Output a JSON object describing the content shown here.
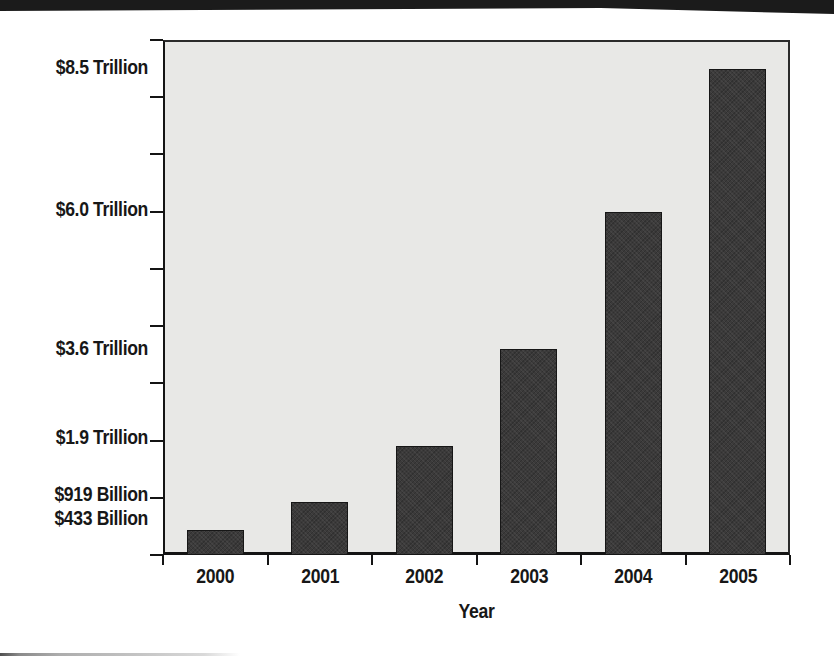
{
  "page": {
    "top_band_color": "#1b1b1b",
    "background_color": "#ffffff"
  },
  "chart_data": {
    "type": "bar",
    "title": "",
    "xlabel": "Year",
    "ylabel": "",
    "categories": [
      "2000",
      "2001",
      "2002",
      "2003",
      "2004",
      "2005"
    ],
    "values": [
      0.433,
      0.919,
      1.9,
      3.6,
      6.0,
      8.5
    ],
    "value_unit": "trillion USD",
    "value_labels": [
      "$433 Billion",
      "$919 Billion",
      "$1.9 Trillion",
      "$3.6 Trillion",
      "$6.0 Trillion",
      "$8.5 Trillion"
    ],
    "ylim": [
      0,
      9
    ],
    "gridline_step": 1.0,
    "grid": true,
    "legend": false,
    "bar_color": "#3b3a3a",
    "plot_background": "#e8e8e6",
    "gridline_color": "#9b9b9b",
    "axis_color": "#141414",
    "text_color": "#171717"
  }
}
